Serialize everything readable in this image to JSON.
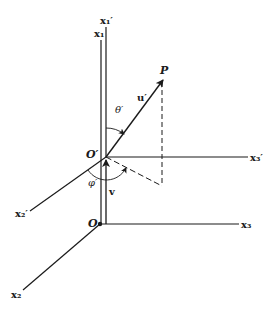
{
  "diagram": {
    "title": "",
    "colors": {
      "ink": "#1a1a1a",
      "background": "#ffffff"
    },
    "labels": {
      "x1_prime": "x₁′",
      "x1": "x₁",
      "x2_prime": "x₂′",
      "x2": "x₂",
      "x3_prime": "x₃′",
      "x3": "x₃",
      "origin": "O",
      "origin_prime": "O′",
      "point": "P",
      "vector_u": "u′",
      "vector_v": "v",
      "theta": "θ′",
      "phi": "φ′"
    },
    "nodes": [
      {
        "id": "O",
        "label": "O",
        "x": 100,
        "y": 224
      },
      {
        "id": "O_prime",
        "label": "O′",
        "x": 106,
        "y": 157
      },
      {
        "id": "P",
        "label": "P",
        "x": 163,
        "y": 79
      }
    ],
    "edges": [
      {
        "from": "O",
        "to": "x1-end",
        "type": "axis",
        "label": "x₁"
      },
      {
        "from": "O",
        "to": "x2-end",
        "type": "axis",
        "label": "x₂"
      },
      {
        "from": "O",
        "to": "x3-end",
        "type": "axis",
        "label": "x₃"
      },
      {
        "from": "O_prime",
        "to": "x1p-end",
        "type": "axis",
        "label": "x₁′"
      },
      {
        "from": "O_prime",
        "to": "x2p-end",
        "type": "axis",
        "label": "x₂′"
      },
      {
        "from": "O_prime",
        "to": "x3p-end",
        "type": "axis",
        "label": "x₃′"
      },
      {
        "from": "O_prime",
        "to": "P",
        "type": "vector",
        "label": "u′"
      },
      {
        "from": "O",
        "to": "O_prime",
        "type": "vector",
        "label": "v"
      },
      {
        "from": "P",
        "to": "projection",
        "type": "dashed"
      },
      {
        "from": "O_prime",
        "to": "projection",
        "type": "dashed"
      }
    ]
  }
}
